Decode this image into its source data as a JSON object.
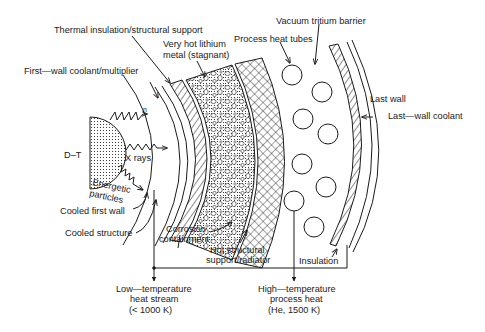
{
  "diagram": {
    "type": "fusion-blanket-cross-section",
    "labels": {
      "thermal_insulation": "Thermal insulation/structural support",
      "very_hot_lithium_1": "Very hot lithium",
      "very_hot_lithium_2": "metal (stagnant)",
      "process_heat_tubes": "Process heat tubes",
      "vacuum_tritium_barrier": "Vacuum tritium barrier",
      "first_wall_coolant": "First—wall coolant/multiplier",
      "last_wall": "Last wall",
      "last_wall_coolant": "Last—wall coolant",
      "dt": "D–T",
      "n": "n",
      "x_rays": "X rays",
      "energetic_1": "Energetic",
      "energetic_2": "particles",
      "cooled_first_wall": "Cooled first wall",
      "cooled_structure": "Cooled structure",
      "corrosion_1": "Corrosion",
      "corrosion_2": "containment",
      "hot_structural_1": "Hot structural",
      "hot_structural_2": "support/radiator",
      "insulation": "Insulation",
      "low_temp_1": "Low—temperature",
      "low_temp_2": "heat stream",
      "low_temp_3": "(< 1000 K)",
      "high_temp_1": "High—temperature",
      "high_temp_2": "process heat",
      "high_temp_3": "(He, 1500 K)"
    },
    "colors": {
      "ink": "#1a1a1a",
      "background": "#ffffff"
    }
  }
}
